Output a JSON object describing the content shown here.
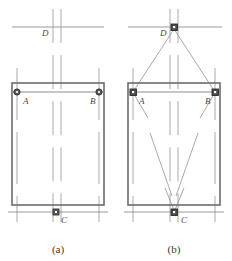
{
  "figure": {
    "type": "engineering-setting-out-diagram",
    "subfigures": [
      {
        "id": "a",
        "caption": "(a)",
        "point_labels": {
          "A": "A",
          "B": "B",
          "C": "C",
          "D": "D"
        },
        "description_points": [
          "A",
          "B",
          "C",
          "D"
        ],
        "has_sight_lines": false
      },
      {
        "id": "b",
        "caption": "(b)",
        "point_labels": {
          "A": "A",
          "B": "B",
          "C": "C",
          "D": "D"
        },
        "description_points": [
          "A",
          "B",
          "C",
          "D"
        ],
        "has_sight_lines": true
      }
    ]
  },
  "colors": {
    "outline": "#6b6b6b",
    "inner_line": "#8c8c8c",
    "center_line": "#a9a9a9",
    "dashed_line": "#9a9a9a",
    "marker_fill": "#555555",
    "marker_stroke": "#333333",
    "text": "#3a3a3a",
    "background": "#ffffff"
  },
  "geometry": {
    "a": {
      "rect": {
        "x": 12,
        "y": 83,
        "w": 92,
        "h": 122
      },
      "beam_y": 92,
      "center_x": 58,
      "markers": [
        {
          "name": "A",
          "x": 17,
          "y": 92,
          "shape": "circle"
        },
        {
          "name": "B",
          "x": 99,
          "y": 92,
          "shape": "circle"
        },
        {
          "name": "C",
          "x": 56,
          "y": 212,
          "shape": "square"
        },
        {
          "name": "D",
          "x": 56,
          "y": 27,
          "shape": "none"
        }
      ]
    },
    "b": {
      "rect": {
        "x": 128,
        "y": 83,
        "w": 92,
        "h": 122
      },
      "beam_y": 92,
      "center_x": 174,
      "markers": [
        {
          "name": "A",
          "x": 133,
          "y": 92,
          "shape": "square"
        },
        {
          "name": "B",
          "x": 215,
          "y": 92,
          "shape": "square"
        },
        {
          "name": "C",
          "x": 174,
          "y": 212,
          "shape": "square"
        },
        {
          "name": "D",
          "x": 174,
          "y": 27,
          "shape": "square"
        }
      ]
    }
  }
}
